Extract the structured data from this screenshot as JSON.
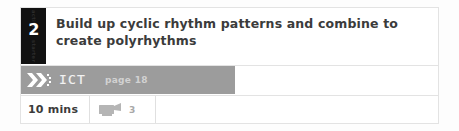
{
  "activity": {
    "number": "2",
    "number_box_vertical_label_top": "activity",
    "number_box_vertical_label_bottom": "starter",
    "objective": "Build up cyclic rhythm patterns and combine to create polyrhythms",
    "objective_line_1": "Build up cyclic rhythm patterns and combine to",
    "objective_line_2": "create polyrhythms"
  },
  "resource": {
    "icon": "double-chevron-right-icon",
    "label": "ICT",
    "page_reference": "page 18"
  },
  "meta": {
    "duration": "10 mins",
    "media_icon": "video-camera-icon",
    "media_count": "3",
    "blank_cell": ""
  },
  "colors": {
    "number_box_background": "#111111",
    "number_text": "#ffffff",
    "objective_text": "#3b3b3b",
    "resource_bar_background": "#9c9c9c",
    "resource_label_text": "#f2f2f2",
    "resource_page_text": "#d2d2d2",
    "cell_border": "#e3e3e3",
    "media_count_text": "#a8a8a8",
    "page_background": "#ffffff"
  }
}
